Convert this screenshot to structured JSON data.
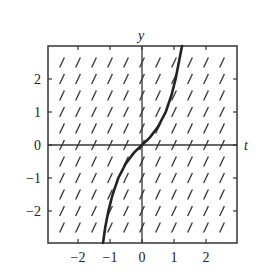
{
  "figure": {
    "type": "slope_field",
    "x_axis_label": "t",
    "y_axis_label": "y",
    "x_ticks": [
      {
        "value": -2,
        "label": "−2"
      },
      {
        "value": -1,
        "label": "−1"
      },
      {
        "value": 0,
        "label": "0"
      },
      {
        "value": 1,
        "label": "1"
      },
      {
        "value": 2,
        "label": "2"
      }
    ],
    "y_ticks": [
      {
        "value": 2,
        "label": "2"
      },
      {
        "value": 1,
        "label": "1"
      },
      {
        "value": 0,
        "label": "0"
      },
      {
        "value": -1,
        "label": "−1"
      },
      {
        "value": -2,
        "label": "−2"
      }
    ],
    "xlim": [
      -3,
      3
    ],
    "ylim": [
      -3,
      3
    ],
    "slope_field": {
      "grid_step": 0.5,
      "t_range": [
        -2.5,
        2.5
      ],
      "y_range": [
        -2.5,
        2.5
      ],
      "slope": 2
    },
    "solution_curve": {
      "passes_through": [
        0,
        0
      ],
      "points": [
        [
          -1.22,
          -3.0
        ],
        [
          -1.15,
          -2.5
        ],
        [
          -1.05,
          -2.0
        ],
        [
          -0.92,
          -1.5
        ],
        [
          -0.74,
          -1.0
        ],
        [
          -0.5,
          -0.55
        ],
        [
          -0.25,
          -0.23
        ],
        [
          0,
          0
        ],
        [
          0.25,
          0.23
        ],
        [
          0.5,
          0.55
        ],
        [
          0.74,
          1.0
        ],
        [
          0.92,
          1.5
        ],
        [
          1.05,
          2.0
        ],
        [
          1.15,
          2.5
        ],
        [
          1.25,
          3.0
        ]
      ]
    },
    "colors": {
      "frame": "#333333",
      "curve": "#222222",
      "marks": "#333333"
    }
  }
}
